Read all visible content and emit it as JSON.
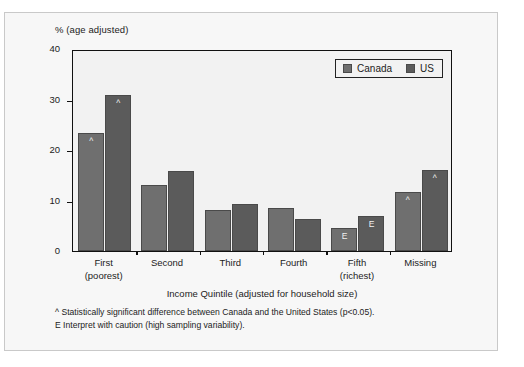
{
  "figure": {
    "y_axis_title": "% (age adjusted)",
    "x_axis_title": "Income Quintile (adjusted for household size)"
  },
  "legend": {
    "position": "top-right",
    "entries": [
      {
        "label": "Canada",
        "color": "#6f6f6f",
        "swatch_icon": "square-swatch-icon"
      },
      {
        "label": "US",
        "color": "#5b5b5b",
        "swatch_icon": "square-swatch-icon"
      }
    ]
  },
  "footnotes": [
    "^ Statistically significant difference between Canada and the United States (p<0.05).",
    "E Interpret with caution (high sampling variability)."
  ],
  "chart_data": {
    "type": "bar",
    "title": "",
    "subtitle": "",
    "xlabel": "Income Quintile (adjusted for household size)",
    "ylabel": "% (age adjusted)",
    "ylim": [
      0,
      40
    ],
    "yticks": [
      0,
      10,
      20,
      30,
      40
    ],
    "ytick_labels": [
      "0",
      "10",
      "20",
      "30",
      "40"
    ],
    "grid": false,
    "legend_position": "top-right",
    "categories": [
      "First",
      "Second",
      "Third",
      "Fourth",
      "Fifth",
      "Missing"
    ],
    "category_sublabels": [
      "(poorest)",
      "",
      "",
      "",
      "(richest)",
      ""
    ],
    "series": [
      {
        "name": "Canada",
        "color": "#6f6f6f",
        "values": [
          23.4,
          13.0,
          8.2,
          8.6,
          4.5,
          11.7
        ],
        "markers": [
          "^",
          "",
          "",
          "",
          "E",
          "^"
        ]
      },
      {
        "name": "US",
        "color": "#5b5b5b",
        "values": [
          30.8,
          15.8,
          9.3,
          6.4,
          7.0,
          16.1
        ],
        "markers": [
          "^",
          "",
          "",
          "",
          "E",
          "^"
        ]
      }
    ],
    "annotations": [
      "^ Statistically significant difference between Canada and the United States (p<0.05).",
      "E Interpret with caution (high sampling variability)."
    ]
  }
}
